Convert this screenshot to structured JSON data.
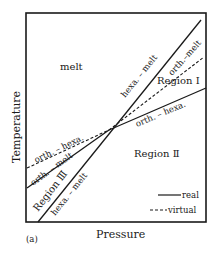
{
  "figure": {
    "panel_label": "(a)",
    "x_axis_label": "Pressure",
    "y_axis_label": "Temperature"
  },
  "regions": {
    "melt": "melt",
    "region_1": "Region Ⅰ",
    "region_2": "Region Ⅱ",
    "region_3": "Region Ⅲ"
  },
  "boundaries": {
    "hexa_melt_upper": "hexa. – melt",
    "orth_melt_upper": "orth.–melt",
    "orth_hexa_right": "orth. – hexa.",
    "orth_hexa_left": "orth. – hexa.",
    "orth_melt_left": "orth. – melt",
    "hexa_melt_lower": "hexa. – melt"
  },
  "legend": {
    "real": "real",
    "virtual": "virtual"
  },
  "colors": {
    "line": "#1a1a1a",
    "background": "#ffffff"
  }
}
